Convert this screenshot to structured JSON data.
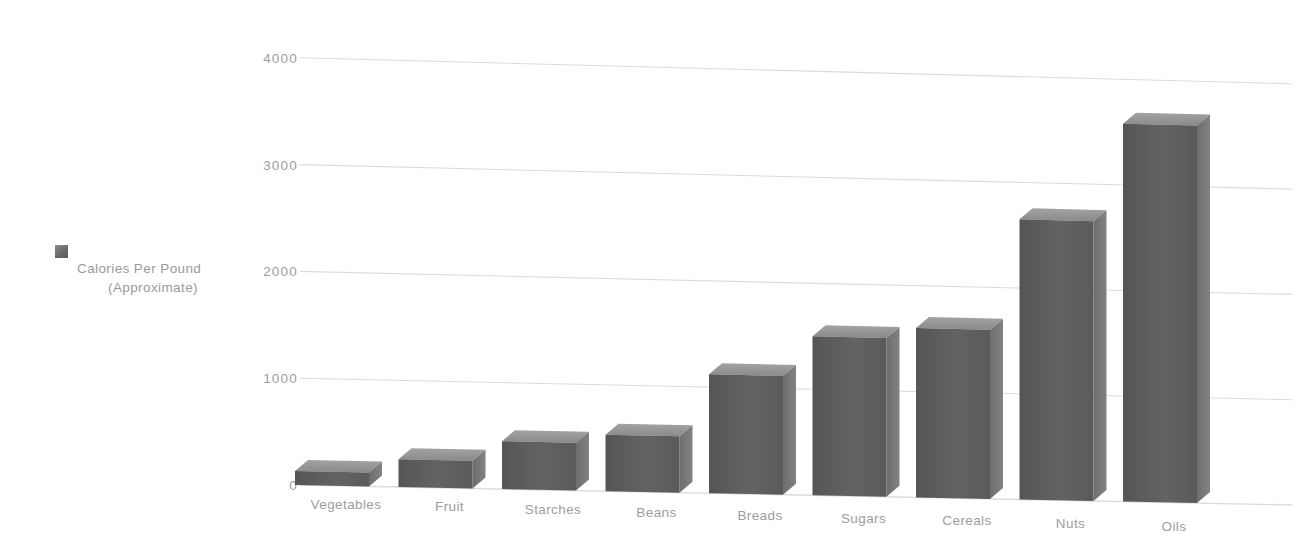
{
  "chart_data": {
    "type": "bar",
    "title": "",
    "subtitle": "",
    "xlabel": "",
    "ylabel": "",
    "ylim": [
      0,
      4000
    ],
    "ytick_values": [
      0,
      1000,
      2000,
      3000,
      4000
    ],
    "ytick_labels": [
      "0",
      "1000",
      "2000",
      "3000",
      "4000"
    ],
    "grid": true,
    "legend_position": "left",
    "style": "3d-bar",
    "categories": [
      "Vegetables",
      "Fruit",
      "Starches",
      "Beans",
      "Breads",
      "Sugars",
      "Cereals",
      "Nuts",
      "Oils"
    ],
    "series": [
      {
        "name": "Calories Per Pound (Approximate)",
        "values": [
          130,
          260,
          450,
          530,
          1120,
          1500,
          1600,
          2650,
          3580
        ],
        "color": "#5f5f5f"
      }
    ]
  },
  "legend": {
    "line1": "Calories Per Pound",
    "line2": "(Approximate)",
    "swatch_color": "#6f6f6f"
  },
  "axes": {
    "y_ticks": [
      "4000",
      "3000",
      "2000",
      "1000",
      "0"
    ],
    "x_ticks": [
      "Vegetables",
      "Fruit",
      "Starches",
      "Beans",
      "Breads",
      "Sugars",
      "Cereals",
      "Nuts",
      "Oils"
    ]
  },
  "colors": {
    "bar_front": "#5d5d5d",
    "bar_side": "#787878",
    "bar_top": "#9a9a9a",
    "gridline": "#dcdcdc",
    "text": "#9d9d9d",
    "background": "#ffffff"
  }
}
